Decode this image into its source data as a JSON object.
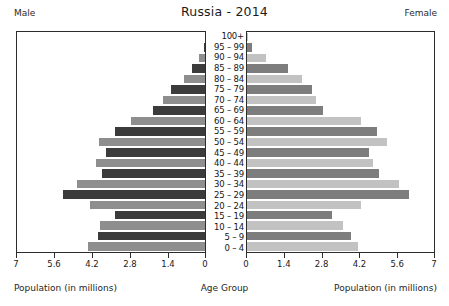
{
  "header": {
    "left_label": "Male",
    "right_label": "Female",
    "title": "Russia - 2014"
  },
  "footer": {
    "left_axis_label": "Population (in millions)",
    "center_axis_label": "Age Group",
    "right_axis_label": "Population (in millions)"
  },
  "colors": {
    "male_dark": "#3b3b3b",
    "male_light": "#8e8e8e",
    "female_dark": "#7d7d7d",
    "female_light": "#c2c2c2",
    "axis": "#2c2c2c",
    "background": "#ffffff",
    "text": "#1a1a1a"
  },
  "chart_data": {
    "type": "bar",
    "title": "Russia - 2014",
    "subtitle": "",
    "orientation": "population-pyramid",
    "xlabel": "Population (in millions)",
    "ylabel": "Age Group",
    "grid": false,
    "legend": "none",
    "xlim_left": [
      7,
      0
    ],
    "xlim_right": [
      0,
      7
    ],
    "left_ticks": [
      "7",
      "5.6",
      "4.2",
      "2.8",
      "1.4",
      "0"
    ],
    "left_tick_values": [
      7,
      5.6,
      4.2,
      2.8,
      1.4,
      0
    ],
    "right_ticks": [
      "0",
      "1.4",
      "2.8",
      "4.2",
      "5.6",
      "7"
    ],
    "right_tick_values": [
      0,
      1.4,
      2.8,
      4.2,
      5.6,
      7
    ],
    "categories": [
      "100+",
      "95 – 99",
      "90 – 94",
      "85 – 89",
      "80 – 84",
      "75 – 79",
      "70 – 74",
      "65 – 69",
      "60 – 64",
      "55 – 59",
      "50 – 54",
      "45 – 49",
      "40 – 44",
      "35 – 39",
      "30 – 34",
      "25 – 29",
      "20 – 24",
      "15 – 19",
      "10 – 14",
      "5 – 9",
      "0 – 4"
    ],
    "series": [
      {
        "name": "Male",
        "side": "left",
        "values": [
          0.01,
          0.05,
          0.22,
          0.5,
          0.78,
          1.25,
          1.55,
          1.95,
          2.75,
          3.35,
          3.95,
          3.7,
          4.05,
          3.85,
          4.75,
          5.3,
          4.3,
          3.35,
          3.9,
          4.0,
          4.35
        ]
      },
      {
        "name": "Female",
        "side": "right",
        "values": [
          0.03,
          0.18,
          0.72,
          1.55,
          2.05,
          2.45,
          2.6,
          2.85,
          4.25,
          4.85,
          5.25,
          4.55,
          4.7,
          4.95,
          5.7,
          6.05,
          4.25,
          3.2,
          3.6,
          3.9,
          4.15
        ]
      }
    ]
  }
}
